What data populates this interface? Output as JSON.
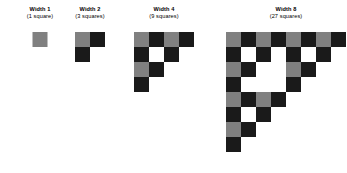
{
  "figure": {
    "background_color": "#ffffff",
    "palette": {
      "gray": "#808080",
      "black": "#1a1a1a",
      "white": "#ffffff",
      "text": "#000000"
    },
    "cell_size_px": 15
  },
  "stages": [
    {
      "id": "width-1",
      "width_label": "Width 1",
      "count_label": "(1 square)",
      "width": 1,
      "square_count": 1,
      "left": 12,
      "top": 6,
      "grid_top": 32,
      "box_width": 56,
      "cell_size": 15,
      "cells": [
        [
          "gray"
        ]
      ]
    },
    {
      "id": "width-2",
      "width_label": "Width 2",
      "count_label": "(3 squares)",
      "width": 2,
      "square_count": 3,
      "left": 62,
      "top": 6,
      "grid_top": 32,
      "box_width": 56,
      "cell_size": 15,
      "cells": [
        [
          "gray",
          "black"
        ],
        [
          "black",
          "empty"
        ]
      ]
    },
    {
      "id": "width-4",
      "width_label": "Width 4",
      "count_label": "(9 squares)",
      "width": 4,
      "square_count": 9,
      "left": 134,
      "top": 6,
      "grid_top": 32,
      "box_width": 60,
      "cell_size": 15,
      "cells": [
        [
          "gray",
          "black",
          "gray",
          "black"
        ],
        [
          "black",
          "white",
          "black",
          "empty"
        ],
        [
          "gray",
          "black",
          "empty",
          "empty"
        ],
        [
          "black",
          "empty",
          "empty",
          "empty"
        ]
      ]
    },
    {
      "id": "width-8",
      "width_label": "Width 8",
      "count_label": "(27 squares)",
      "width": 8,
      "square_count": 27,
      "left": 226,
      "top": 6,
      "grid_top": 32,
      "box_width": 120,
      "cell_size": 15,
      "cells": [
        [
          "gray",
          "black",
          "gray",
          "black",
          "gray",
          "black",
          "gray",
          "black"
        ],
        [
          "black",
          "white",
          "black",
          "white",
          "black",
          "white",
          "black",
          "empty"
        ],
        [
          "gray",
          "black",
          "white",
          "white",
          "gray",
          "black",
          "empty",
          "empty"
        ],
        [
          "black",
          "white",
          "white",
          "white",
          "black",
          "empty",
          "empty",
          "empty"
        ],
        [
          "gray",
          "black",
          "gray",
          "black",
          "empty",
          "empty",
          "empty",
          "empty"
        ],
        [
          "black",
          "white",
          "black",
          "empty",
          "empty",
          "empty",
          "empty",
          "empty"
        ],
        [
          "gray",
          "black",
          "empty",
          "empty",
          "empty",
          "empty",
          "empty",
          "empty"
        ],
        [
          "black",
          "empty",
          "empty",
          "empty",
          "empty",
          "empty",
          "empty",
          "empty"
        ]
      ]
    }
  ]
}
